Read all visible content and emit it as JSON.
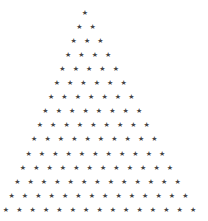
{
  "pattern": {
    "type": "star-triangle",
    "glyph": "★",
    "rows": 15,
    "stars_per_row": [
      1,
      2,
      3,
      4,
      5,
      6,
      7,
      8,
      9,
      10,
      11,
      12,
      13,
      14,
      15
    ],
    "color": "#444444",
    "background": "#ffffff",
    "layout": {
      "first_row_left_x": 85,
      "last_row_left_x": 6,
      "first_row_y": 12.5,
      "last_row_y": 210,
      "horizontal_spacing": 13.36
    }
  }
}
